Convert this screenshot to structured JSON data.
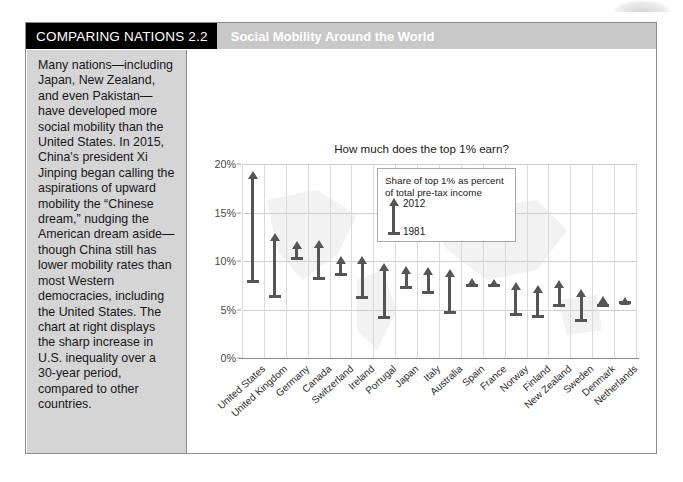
{
  "header": {
    "tag": "COMPARING NATIONS 2.2",
    "title": "Social Mobility Around the World",
    "tag_bg": "#000000",
    "band_bg": "#c8c8c8"
  },
  "sidebar": {
    "body": "Many nations—including Japan, New Zealand, and even Pakistan—have developed more social mobility than the United States. In 2015, China's president Xi Jinping began calling the aspirations of upward mobility the “Chinese dream,” nudging the American dream aside—though China still has lower mobility rates than most Western democracies, including the United States. The chart at right displays the sharp increase in U.S. inequality over a 30-year period, compared to other countries.",
    "bg": "#d5d5d5"
  },
  "legend": {
    "caption": "Share of top 1% as percent of total pre-tax income",
    "top_label": "2012",
    "bottom_label": "1981",
    "marker_color": "#555558"
  },
  "chart_data": {
    "type": "bar",
    "title": "How much does the top 1% earn?",
    "xlabel": "",
    "ylabel": "",
    "ylim": [
      0,
      20
    ],
    "ytick_labels": [
      "0%",
      "5%",
      "10%",
      "15%",
      "20%"
    ],
    "ytick_values": [
      0,
      5,
      10,
      15,
      20
    ],
    "grid": true,
    "legend_position": "inside-top-left",
    "categories": [
      "United States",
      "United Kingdom",
      "Germany",
      "Canada",
      "Switzerland",
      "Ireland",
      "Portugal",
      "Japan",
      "Italy",
      "Australia",
      "Spain",
      "France",
      "Norway",
      "Finland",
      "New Zealand",
      "Sweden",
      "Denmark",
      "Netherlands"
    ],
    "series": [
      {
        "name": "1981",
        "values": [
          8.0,
          6.5,
          10.4,
          8.4,
          8.8,
          6.4,
          4.3,
          7.4,
          6.9,
          4.8,
          7.6,
          7.6,
          4.6,
          4.4,
          5.6,
          4.0,
          5.6,
          5.9
        ]
      },
      {
        "name": "2012",
        "values": [
          19.3,
          12.9,
          12.1,
          12.2,
          10.5,
          10.5,
          9.8,
          9.5,
          9.4,
          9.2,
          8.2,
          8.1,
          7.8,
          7.5,
          8.0,
          7.1,
          6.4,
          6.3
        ]
      }
    ]
  }
}
